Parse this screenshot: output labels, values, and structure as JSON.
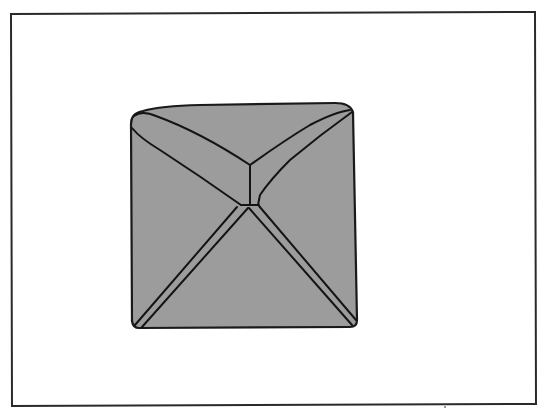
{
  "figure": {
    "description": "Line drawing of a square gray form with diagonal crease/edge lines meeting near the center, enclosed in a rectangular frame",
    "colors": {
      "background": "#ffffff",
      "frame_stroke": "#2a2a2a",
      "shape_fill": "#9c9c9c",
      "line_stroke": "#141414"
    },
    "frame": {
      "x": 11,
      "y": 13,
      "width": 525,
      "height": 392
    },
    "shape": {
      "corners": {
        "top_left": [
          130,
          116
        ],
        "top_right": [
          353,
          108
        ],
        "bottom_right": [
          357,
          326
        ],
        "bottom_left": [
          134,
          328
        ]
      },
      "center_junction": [
        250,
        205
      ]
    }
  }
}
